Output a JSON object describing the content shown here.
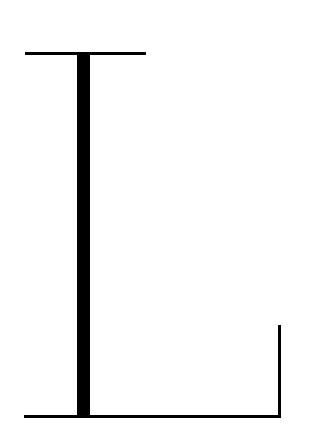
{
  "diagram": {
    "elements": [
      {
        "name": "top-crossbar",
        "shape": "horizontal-line"
      },
      {
        "name": "thick-stem",
        "shape": "vertical-bar"
      },
      {
        "name": "baseline",
        "shape": "horizontal-line"
      },
      {
        "name": "right-post",
        "shape": "vertical-line"
      }
    ],
    "colors": {
      "stroke": "#000000",
      "background": "#ffffff"
    }
  }
}
